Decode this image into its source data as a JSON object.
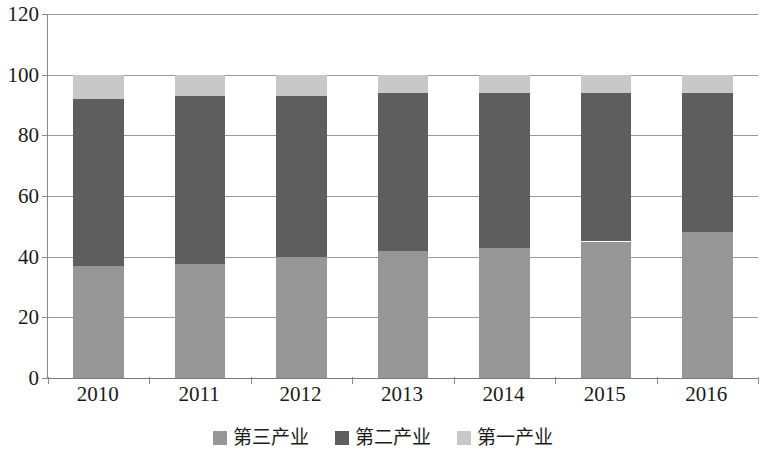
{
  "chart_data": {
    "type": "bar",
    "subtype": "stacked-percentage-column",
    "title": "",
    "subtitle": "",
    "xlabel": "",
    "ylabel": "",
    "categories": [
      "2010",
      "2011",
      "2012",
      "2013",
      "2014",
      "2015",
      "2016"
    ],
    "ylim": [
      0,
      120
    ],
    "yticks": [
      0,
      20,
      40,
      60,
      80,
      100,
      120
    ],
    "ytick_labels": [
      "0",
      "20",
      "40",
      "60",
      "80",
      "100",
      "120"
    ],
    "grid": true,
    "grid_axis": "y",
    "legend_position": "bottom",
    "stack_order_bottom_to_top": [
      "第三产业",
      "第二产业",
      "第一产业"
    ],
    "series": [
      {
        "name": "第三产业",
        "color": "#969696",
        "values": [
          37.0,
          37.5,
          40.0,
          42.0,
          43.0,
          45.0,
          48.0
        ]
      },
      {
        "name": "第二产业",
        "color": "#5e5e5e",
        "values": [
          55.0,
          55.5,
          53.0,
          52.0,
          51.0,
          49.0,
          46.0
        ]
      },
      {
        "name": "第一产业",
        "color": "#c8c8c8",
        "values": [
          8.0,
          7.0,
          7.0,
          6.0,
          6.0,
          6.0,
          6.0
        ]
      }
    ],
    "stack_tops": {
      "tertiary_top": [
        37.0,
        37.5,
        40.0,
        42.0,
        43.0,
        45.0,
        48.0
      ],
      "secondary_top": [
        92.0,
        93.0,
        93.0,
        94.0,
        94.0,
        94.0,
        94.0
      ],
      "total": [
        100,
        100,
        100,
        100,
        100,
        100,
        100
      ]
    }
  },
  "legend": {
    "items": [
      {
        "label": "第三产业",
        "color": "#969696",
        "swatch_name": "legend-swatch-tertiary"
      },
      {
        "label": "第二产业",
        "color": "#5e5e5e",
        "swatch_name": "legend-swatch-secondary"
      },
      {
        "label": "第一产业",
        "color": "#c8c8c8",
        "swatch_name": "legend-swatch-primary"
      }
    ]
  },
  "style": {
    "background": "#ffffff",
    "gridline_color": "#9a9a9a",
    "axis_color": "#8a8a8a",
    "text_color": "#1a1a1a"
  }
}
